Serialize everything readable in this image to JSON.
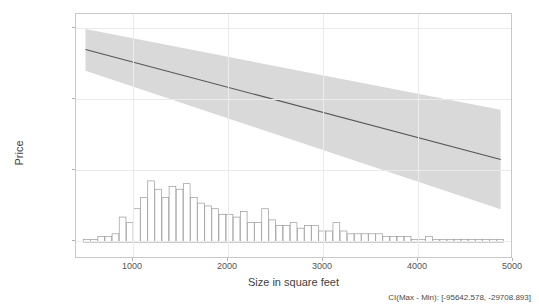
{
  "chart_data": {
    "type": "line",
    "title": "",
    "xlabel": "Size in square feet",
    "ylabel": "Price",
    "xlim": [
      400,
      5000
    ],
    "ylim": [
      -130000,
      8000
    ],
    "xticks": [
      1000,
      2000,
      3000,
      4000,
      5000
    ],
    "xtick_labels": [
      "1000",
      "2000",
      "3000",
      "4000",
      "5000"
    ],
    "yticks": [
      0,
      -40000,
      -80000,
      -120000
    ],
    "ytick_labels": [
      "0",
      "-40000",
      "-80000",
      "-120000"
    ],
    "grid": true,
    "legend": "none",
    "annotation": "CI(Max - Min): [-95642.578, -29708.893]",
    "ci_min": -95642.578,
    "ci_max": -29708.893,
    "series": [
      {
        "name": "fitted-effect",
        "type": "line",
        "color": "#555555",
        "x": [
          500,
          4870
        ],
        "values": [
          -12000,
          -74000
        ]
      },
      {
        "name": "confidence-band-upper",
        "type": "area",
        "color": "#d9d9d9",
        "x": [
          500,
          4870
        ],
        "values": [
          -500,
          -46000
        ]
      },
      {
        "name": "confidence-band-lower",
        "type": "area",
        "color": "#d9d9d9",
        "x": [
          500,
          4870
        ],
        "values": [
          -24000,
          -102000
        ]
      },
      {
        "name": "size-distribution-histogram",
        "type": "bar",
        "color": "#ffffff",
        "edge_color": "#9a9a9a",
        "baseline": -120500,
        "bin_width": 75,
        "bin_starts": [
          480,
          555,
          630,
          705,
          780,
          855,
          930,
          1005,
          1080,
          1155,
          1230,
          1305,
          1380,
          1455,
          1530,
          1605,
          1680,
          1755,
          1830,
          1905,
          1980,
          2055,
          2130,
          2205,
          2280,
          2355,
          2430,
          2505,
          2580,
          2655,
          2730,
          2805,
          2880,
          2955,
          3030,
          3105,
          3180,
          3255,
          3330,
          3405,
          3480,
          3555,
          3630,
          3705,
          3780,
          3855,
          3930,
          4005,
          4080,
          4155,
          4230,
          4305,
          4380,
          4455,
          4530,
          4605,
          4680,
          4755,
          4830
        ],
        "values": [
          1,
          1,
          2,
          2,
          3,
          9,
          7,
          12,
          16,
          22,
          19,
          16,
          20,
          19,
          21,
          16,
          14,
          13,
          12,
          10,
          10,
          9,
          11,
          7,
          7,
          12,
          8,
          6,
          6,
          7,
          5,
          6,
          6,
          4,
          4,
          7,
          4,
          3,
          3,
          3,
          3,
          3,
          2,
          2,
          2,
          2,
          1,
          1,
          2,
          1,
          1,
          1,
          1,
          1,
          1,
          1,
          1,
          1,
          1
        ]
      }
    ]
  },
  "axes": {
    "ylabel": "Price",
    "xlabel": "Size in square feet"
  },
  "caption": {
    "text": "CI(Max - Min): [-95642.578, -29708.893]"
  }
}
